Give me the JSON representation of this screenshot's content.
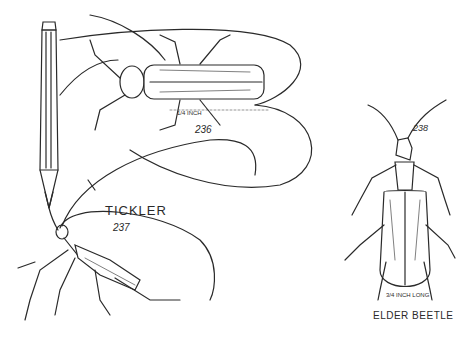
{
  "illustration": {
    "figures": [
      {
        "id": "236",
        "number_label": "236",
        "scale_label": "1/4 INCH",
        "description": "longhorn beetle viewed from above with long curved antennae"
      },
      {
        "id": "237",
        "name_label": "TICKLER",
        "number_label": "237",
        "description": "insect tethered by a thread to a pencil tip"
      },
      {
        "id": "238",
        "number_label": "238",
        "scale_label": "3/4 INCH LONG",
        "name_label": "ELDER BEETLE",
        "description": "elder beetle viewed from above"
      }
    ],
    "colors": {
      "ink": "#2a2a2a",
      "paper": "#ffffff"
    }
  }
}
